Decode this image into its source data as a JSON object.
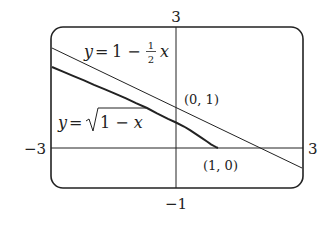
{
  "figure": {
    "window": {
      "xmin": -3,
      "xmax": 3,
      "ymin": -1,
      "ymax": 3
    },
    "tick_labels": {
      "ymax": "3",
      "ymin": "−1",
      "xmin": "−3",
      "xmax": "3"
    },
    "curves": [
      {
        "name": "tangent-line",
        "equation": "y = 1 − ½ x",
        "label_lhs": "y",
        "label_eq": "=",
        "label_rhs": "1 −",
        "frac_num": "1",
        "frac_den": "2",
        "label_var": "x"
      },
      {
        "name": "sqrt-curve",
        "equation": "y = √(1 − x)",
        "label_lhs": "y",
        "label_eq": "=",
        "label_rad": "1 − x"
      }
    ],
    "points": [
      {
        "label": "(0, 1)",
        "x": 0,
        "y": 1
      },
      {
        "label": "(1, 0)",
        "x": 1,
        "y": 0
      }
    ]
  }
}
